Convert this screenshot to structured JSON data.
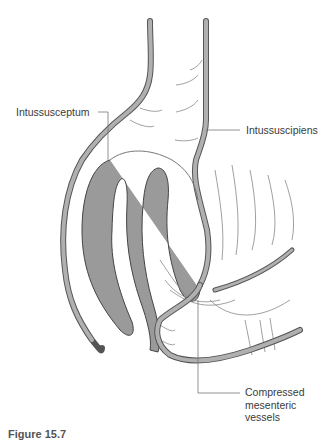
{
  "diagram": {
    "colors": {
      "wall_fill": "#a8a8a8",
      "wall_outline": "#555555",
      "intussusceptum_fill": "#9a9a9a",
      "lines": "#777777",
      "text": "#3a3a3a"
    },
    "labels": {
      "intussusceptum": "Intussusceptum",
      "intussuscipiens": "Intussuscipiens",
      "compressed_line1": "Compressed",
      "compressed_line2": "mesenteric",
      "compressed_line3": "vessels"
    },
    "caption": "Figure 15.7"
  }
}
